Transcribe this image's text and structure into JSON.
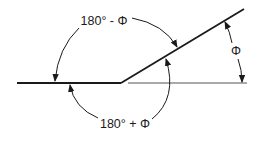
{
  "diagram": {
    "labels": {
      "top": "180° - Φ",
      "bottom": "180° + Φ",
      "right": "Φ"
    },
    "colors": {
      "line": "#1a1a1a",
      "reference_line": "#555555",
      "background": "#ffffff"
    }
  }
}
